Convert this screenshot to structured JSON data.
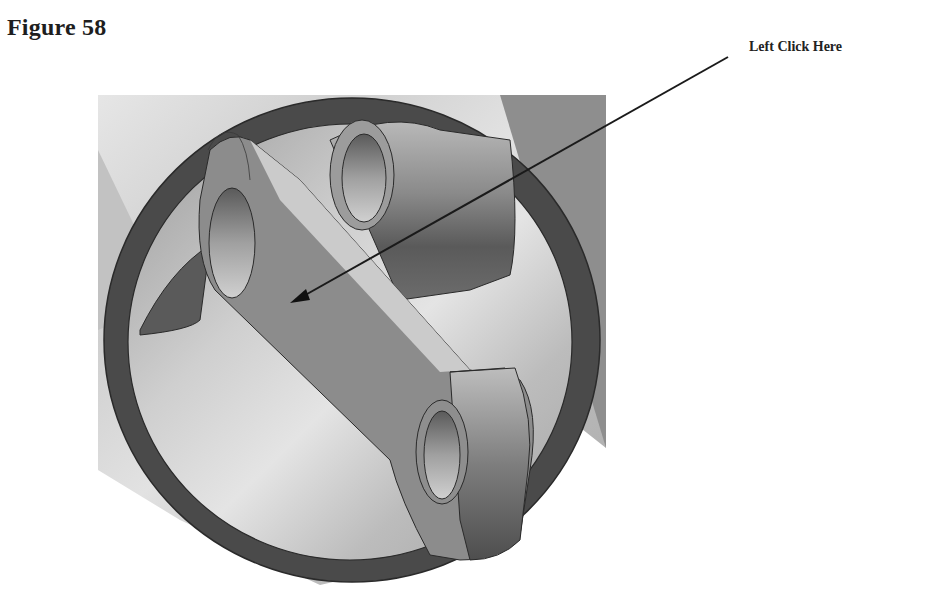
{
  "figure": {
    "title": "Figure 58",
    "callout_label": "Left Click Here",
    "arrow": {
      "from": [
        728,
        57
      ],
      "to": [
        292,
        302
      ],
      "color": "#1a1a1a"
    },
    "render_description": "3D CAD model: cylindrical housing with dark circular rim, crossing link arm with two bored holes",
    "colors": {
      "background": "#ffffff",
      "rim": "#4a4a4a",
      "link_face": "#8a8a8a",
      "highlight": "#d8d8d8",
      "shadow": "#5e5e5e"
    }
  }
}
